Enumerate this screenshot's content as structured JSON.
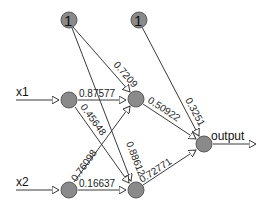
{
  "diagram": {
    "type": "neural-network",
    "nodes": {
      "bias1": {
        "label": "1"
      },
      "bias2": {
        "label": "1"
      },
      "input1": {
        "label": "x1"
      },
      "input2": {
        "label": "x2"
      },
      "hidden1": {
        "label": ""
      },
      "hidden2": {
        "label": ""
      },
      "output": {
        "label": "output"
      }
    },
    "weights": {
      "bias1_hidden1": "0.7209",
      "bias1_hidden2": "0.88612",
      "x1_hidden1": "0.87577",
      "x1_hidden2": "0.45648",
      "x2_hidden1": "0.76098",
      "x2_hidden2": "0.16637",
      "hidden1_output": "0.50922",
      "hidden2_output": "0.72771",
      "bias2_output": "0.3251"
    },
    "colors": {
      "node_fill": "#8a8a8a",
      "edge": "#3a3a3a",
      "background": "#ffffff"
    }
  }
}
